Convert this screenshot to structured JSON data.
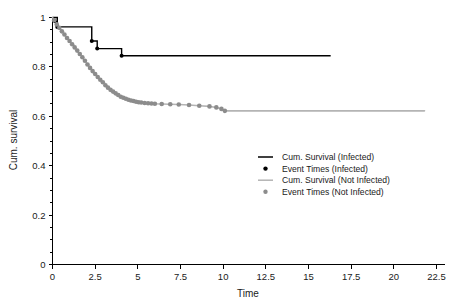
{
  "chart_data": {
    "type": "line",
    "title": "",
    "xlabel": "Time",
    "ylabel": "Cum. survival",
    "xlim": [
      0,
      23.0
    ],
    "ylim": [
      0,
      1.05
    ],
    "xticks": [
      "0",
      "2.5",
      "5",
      "7.5",
      "10",
      "12.5",
      "15",
      "17.5",
      "20",
      "22.5"
    ],
    "xtick_values": [
      0,
      2.5,
      5,
      7.5,
      10,
      12.5,
      15,
      17.5,
      20,
      22.5
    ],
    "yticks": [
      "0",
      "0.2",
      "0.4",
      "0.6",
      "0.8",
      "1"
    ],
    "ytick_values": [
      0,
      0.2,
      0.4,
      0.6,
      0.8,
      1
    ],
    "grid": false,
    "legend_position": "center-right",
    "series": [
      {
        "name": "Cum. Survival (Infected)",
        "color": "#000000",
        "style": "step",
        "x": [
          0,
          0.28,
          0.28,
          2.3,
          2.3,
          2.62,
          2.62,
          4.05,
          4.05,
          16.3
        ],
        "y": [
          1.0,
          1.0,
          0.962,
          0.962,
          0.905,
          0.905,
          0.874,
          0.874,
          0.845,
          0.845
        ]
      },
      {
        "name": "Event Times (Infected)",
        "color": "#000000",
        "style": "markers",
        "x": [
          0.15,
          0.28,
          2.3,
          2.62,
          4.05
        ],
        "y": [
          0.985,
          0.962,
          0.905,
          0.874,
          0.845
        ]
      },
      {
        "name": "Cum. Survival (Not Infected)",
        "color": "#b4b4b4",
        "style": "step",
        "x": [
          0,
          0.2,
          0.4,
          0.6,
          0.8,
          1.0,
          1.2,
          1.4,
          1.6,
          1.8,
          2.0,
          2.2,
          2.4,
          2.6,
          2.8,
          3.0,
          3.2,
          3.4,
          3.6,
          3.8,
          4.0,
          4.2,
          4.4,
          4.6,
          4.8,
          5.0,
          5.2,
          5.4,
          5.6,
          5.8,
          6.0,
          6.4,
          6.9,
          7.4,
          8.0,
          8.6,
          9.2,
          9.6,
          9.9,
          10.1,
          21.8
        ],
        "y": [
          1.0,
          0.978,
          0.958,
          0.94,
          0.922,
          0.905,
          0.888,
          0.87,
          0.852,
          0.834,
          0.816,
          0.798,
          0.781,
          0.764,
          0.748,
          0.733,
          0.719,
          0.707,
          0.696,
          0.687,
          0.679,
          0.673,
          0.668,
          0.664,
          0.661,
          0.658,
          0.656,
          0.654,
          0.653,
          0.652,
          0.651,
          0.65,
          0.649,
          0.648,
          0.646,
          0.643,
          0.64,
          0.636,
          0.63,
          0.622,
          0.622
        ]
      },
      {
        "name": "Event Times (Not Infected)",
        "color": "#8c8c8c",
        "style": "markers",
        "x": [
          0.1,
          0.25,
          0.4,
          0.55,
          0.7,
          0.85,
          1.0,
          1.15,
          1.3,
          1.45,
          1.6,
          1.75,
          1.9,
          2.05,
          2.2,
          2.35,
          2.5,
          2.65,
          2.8,
          2.95,
          3.1,
          3.25,
          3.4,
          3.55,
          3.7,
          3.85,
          4.0,
          4.15,
          4.3,
          4.45,
          4.6,
          4.75,
          4.9,
          5.05,
          5.2,
          5.4,
          5.6,
          5.8,
          6.0,
          6.4,
          6.9,
          7.4,
          8.0,
          8.6,
          9.2,
          9.6,
          9.9,
          10.1
        ],
        "y": [
          0.989,
          0.972,
          0.958,
          0.944,
          0.931,
          0.917,
          0.905,
          0.892,
          0.879,
          0.866,
          0.852,
          0.839,
          0.825,
          0.81,
          0.796,
          0.783,
          0.771,
          0.759,
          0.748,
          0.738,
          0.726,
          0.716,
          0.707,
          0.7,
          0.693,
          0.686,
          0.679,
          0.675,
          0.671,
          0.667,
          0.664,
          0.662,
          0.659,
          0.657,
          0.656,
          0.654,
          0.653,
          0.652,
          0.651,
          0.65,
          0.649,
          0.648,
          0.646,
          0.643,
          0.64,
          0.636,
          0.63,
          0.622
        ]
      }
    ]
  },
  "axes": {
    "x_title": "Time",
    "y_title": "Cum. survival"
  },
  "legend": {
    "entries": [
      {
        "label": "Cum. Survival (Infected)",
        "marker": "line",
        "color": "#000000"
      },
      {
        "label": "Event Times (Infected)",
        "marker": "dot",
        "color": "#000000"
      },
      {
        "label": "Cum. Survival (Not Infected)",
        "marker": "line",
        "color": "#b4b4b4"
      },
      {
        "label": "Event Times (Not Infected)",
        "marker": "dot",
        "color": "#8c8c8c"
      }
    ]
  }
}
